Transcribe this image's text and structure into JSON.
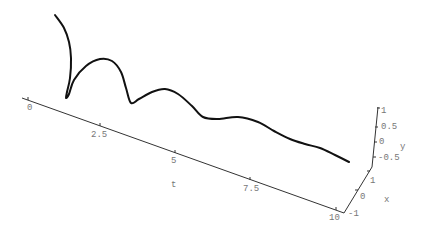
{
  "chart_data": {
    "type": "line",
    "subtype": "3d-parametric-curve",
    "title": "",
    "axes": {
      "t": {
        "label": "t",
        "range": [
          0,
          10
        ],
        "ticks": [
          "0",
          "2.5",
          "5",
          "7.5",
          "10"
        ]
      },
      "x": {
        "label": "x",
        "range": [
          -1,
          1
        ],
        "ticks": [
          "-1",
          "0",
          "1"
        ]
      },
      "y": {
        "label": "y",
        "range": [
          -0.5,
          1
        ],
        "ticks": [
          "-0.5",
          "0",
          "0.5",
          "1"
        ]
      }
    },
    "grid": false,
    "legend": null,
    "series": [
      {
        "name": "curve",
        "description": "Damped spiral along t-axis; oscillation amplitude decreases as t increases",
        "screen_points": [
          [
            55,
            15
          ],
          [
            64,
            28
          ],
          [
            69,
            42
          ],
          [
            71,
            58
          ],
          [
            70,
            78
          ],
          [
            67,
            92
          ],
          [
            66,
            98
          ],
          [
            69,
            94
          ],
          [
            74,
            80
          ],
          [
            86,
            66
          ],
          [
            100,
            59
          ],
          [
            112,
            61
          ],
          [
            121,
            72
          ],
          [
            126,
            88
          ],
          [
            131,
            103
          ],
          [
            139,
            99
          ],
          [
            152,
            92
          ],
          [
            165,
            89
          ],
          [
            178,
            94
          ],
          [
            192,
            106
          ],
          [
            203,
            117
          ],
          [
            218,
            119
          ],
          [
            238,
            117
          ],
          [
            258,
            122
          ],
          [
            274,
            131
          ],
          [
            290,
            139
          ],
          [
            305,
            144
          ],
          [
            320,
            148
          ],
          [
            335,
            155
          ],
          [
            349,
            162
          ]
        ]
      }
    ]
  },
  "labels": {
    "t_ticks": [
      "0",
      "2.5",
      "5",
      "7.5",
      "10"
    ],
    "t_axis": "t",
    "x_ticks": [
      "-1",
      "0",
      "1"
    ],
    "x_axis": "x",
    "y_ticks": [
      "-0.5",
      "0",
      "0.5",
      "1"
    ],
    "y_axis": "y"
  }
}
